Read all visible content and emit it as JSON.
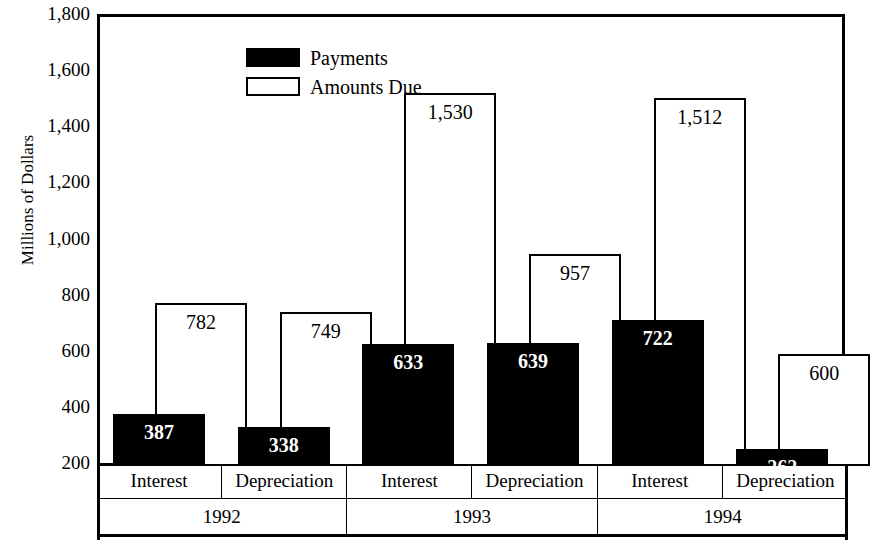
{
  "chart_data": {
    "type": "bar",
    "title": "",
    "xlabel": "",
    "ylabel": "Millions of Dollars",
    "ylim": [
      200,
      1800
    ],
    "ytick_labels": [
      "1,800",
      "1,600",
      "1,400",
      "1,200",
      "1,000",
      "800",
      "600",
      "400",
      "200"
    ],
    "ytick_values": [
      1800,
      1600,
      1400,
      1200,
      1000,
      800,
      600,
      400,
      200
    ],
    "grid": false,
    "legend_position": "top-left",
    "legend": [
      "Payments",
      "Amounts Due"
    ],
    "group_labels": [
      "1992",
      "1993",
      "1994"
    ],
    "categories": [
      "Interest",
      "Depreciation",
      "Interest",
      "Depreciation",
      "Interest",
      "Depreciation"
    ],
    "series": [
      {
        "name": "Payments",
        "color": "#000000",
        "values": [
          387,
          338,
          633,
          639,
          722,
          262
        ],
        "labels": [
          "387",
          "338",
          "633",
          "639",
          "722",
          "262"
        ]
      },
      {
        "name": "Amounts Due",
        "color": "#ffffff",
        "values": [
          782,
          749,
          1530,
          957,
          1512,
          600
        ],
        "labels": [
          "782",
          "749",
          "1,530",
          "957",
          "1,512",
          "600"
        ]
      }
    ],
    "groups": [
      {
        "year": "1992",
        "items": [
          {
            "category": "Interest",
            "payments": 387,
            "payments_label": "387",
            "amounts_due": 782,
            "amounts_due_label": "782"
          },
          {
            "category": "Depreciation",
            "payments": 338,
            "payments_label": "338",
            "amounts_due": 749,
            "amounts_due_label": "749"
          }
        ]
      },
      {
        "year": "1993",
        "items": [
          {
            "category": "Interest",
            "payments": 633,
            "payments_label": "633",
            "amounts_due": 1530,
            "amounts_due_label": "1,530"
          },
          {
            "category": "Depreciation",
            "payments": 639,
            "payments_label": "639",
            "amounts_due": 957,
            "amounts_due_label": "957"
          }
        ]
      },
      {
        "year": "1994",
        "items": [
          {
            "category": "Interest",
            "payments": 722,
            "payments_label": "722",
            "amounts_due": 1512,
            "amounts_due_label": "1,512"
          },
          {
            "category": "Depreciation",
            "payments": 262,
            "payments_label": "262",
            "amounts_due": 600,
            "amounts_due_label": "600"
          }
        ]
      }
    ]
  }
}
